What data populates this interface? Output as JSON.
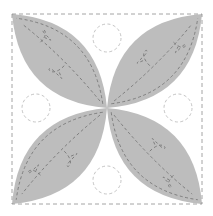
{
  "block": {
    "background": "#ffffff",
    "petal_fill": "#bdbdbd",
    "stitch_color": "#6f6f6f",
    "border_stitch_color": "#9a9a9a",
    "circle_stitch_color": "#b5b5b5",
    "bounds": {
      "x1": 12,
      "y1": 14,
      "x2": 202,
      "y2": 204
    },
    "center": {
      "x": 107,
      "y": 108
    }
  },
  "petals": [
    {
      "name": "petal-top-left",
      "corner": "tl"
    },
    {
      "name": "petal-top-right",
      "corner": "tr"
    },
    {
      "name": "petal-bottom-left",
      "corner": "bl"
    },
    {
      "name": "petal-bottom-right",
      "corner": "br"
    }
  ],
  "circles": [
    {
      "name": "circle-top",
      "cx": 107,
      "cy": 38,
      "r": 14
    },
    {
      "name": "circle-right",
      "cx": 178,
      "cy": 108,
      "r": 14
    },
    {
      "name": "circle-bottom",
      "cx": 107,
      "cy": 180,
      "r": 14
    },
    {
      "name": "circle-left",
      "cx": 36,
      "cy": 108,
      "r": 14
    }
  ]
}
